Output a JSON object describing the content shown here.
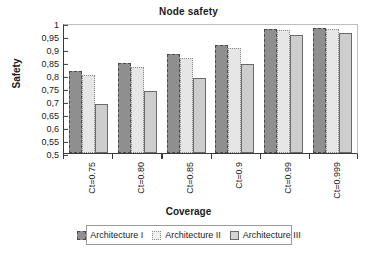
{
  "chart_data": {
    "type": "bar",
    "title": "Node safety",
    "xlabel": "Coverage",
    "ylabel": "Safety",
    "categories": [
      "Ct=0.75",
      "Ct=0.80",
      "Ct=0.85",
      "Ct=0.9",
      "Ct=0.99",
      "Ct=0.999"
    ],
    "series": [
      {
        "name": "Architecture I",
        "values": [
          0.815,
          0.847,
          0.88,
          0.917,
          0.977,
          0.982
        ]
      },
      {
        "name": "Architecture II",
        "values": [
          0.8,
          0.832,
          0.865,
          0.905,
          0.973,
          0.978
        ]
      },
      {
        "name": "Architecture III",
        "values": [
          0.69,
          0.738,
          0.787,
          0.843,
          0.953,
          0.963
        ]
      }
    ],
    "ylim": [
      0.5,
      1.0
    ],
    "ytick_labels": [
      "1",
      "0,95",
      "0,9",
      "0,85",
      "0,8",
      "0,75",
      "0,7",
      "0,65",
      "0,6",
      "0,55",
      "0,5"
    ],
    "ytick_values": [
      1.0,
      0.95,
      0.9,
      0.85,
      0.8,
      0.75,
      0.7,
      0.65,
      0.6,
      0.55,
      0.5
    ],
    "grid": false,
    "legend_position": "bottom",
    "colors": {
      "series1": "#8f8f8f",
      "series2": "#e6e6e6",
      "series3": "#cdcdcd",
      "axis": "#3a3a3a",
      "background": "#ffffff"
    }
  }
}
